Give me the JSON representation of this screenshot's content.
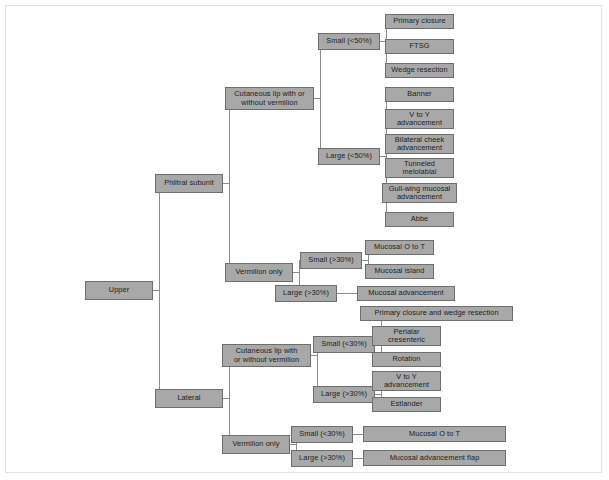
{
  "diagram": {
    "type": "tree-flowchart",
    "colors": {
      "node_fill": "#a8a8a8",
      "node_border": "#6e6e6e",
      "edge": "#8c8c8c",
      "frame": "#e2e2e2",
      "background": "#ffffff",
      "text": "#1c1c1c"
    },
    "nodes": [
      {
        "id": "upper",
        "label": "Upper",
        "x": 85,
        "y": 281,
        "w": 68,
        "h": 19
      },
      {
        "id": "philtral",
        "label": "Philtral subunit",
        "x": 155,
        "y": 174,
        "w": 68,
        "h": 19
      },
      {
        "id": "lateral",
        "label": "Lateral",
        "x": 155,
        "y": 389,
        "w": 68,
        "h": 19
      },
      {
        "id": "p-cut",
        "label": "Cutaneous lip with or\nwithout vermilion",
        "x": 225,
        "y": 87,
        "w": 89,
        "h": 23
      },
      {
        "id": "p-verm",
        "label": "Vermilion only",
        "x": 225,
        "y": 263,
        "w": 68,
        "h": 19
      },
      {
        "id": "p-cut-small",
        "label": "Small (<50%)",
        "x": 318,
        "y": 33,
        "w": 62,
        "h": 17
      },
      {
        "id": "p-cut-large",
        "label": "Large (<50%)",
        "x": 318,
        "y": 148,
        "w": 62,
        "h": 17
      },
      {
        "id": "primary-closure",
        "label": "Primary closure",
        "x": 385,
        "y": 14,
        "w": 69,
        "h": 15
      },
      {
        "id": "ftsg",
        "label": "FTSG",
        "x": 385,
        "y": 39,
        "w": 69,
        "h": 15
      },
      {
        "id": "wedge-resection",
        "label": "Wedge resection",
        "x": 385,
        "y": 63,
        "w": 69,
        "h": 15
      },
      {
        "id": "banner",
        "label": "Banner",
        "x": 385,
        "y": 87,
        "w": 69,
        "h": 15
      },
      {
        "id": "v-to-y-1",
        "label": "V to Y\nadvancement",
        "x": 385,
        "y": 109,
        "w": 69,
        "h": 20
      },
      {
        "id": "bilat-cheek",
        "label": "Bilateral cheek\nadvancement",
        "x": 385,
        "y": 134,
        "w": 69,
        "h": 20
      },
      {
        "id": "tunneled-melo",
        "label": "Tunneled\nmelolabial",
        "x": 385,
        "y": 158,
        "w": 69,
        "h": 20
      },
      {
        "id": "gull-wing",
        "label": "Gull-wing mucosal\nadvancement",
        "x": 382,
        "y": 183,
        "w": 75,
        "h": 20
      },
      {
        "id": "abbe",
        "label": "Abbe",
        "x": 385,
        "y": 212,
        "w": 69,
        "h": 15
      },
      {
        "id": "p-verm-small",
        "label": "Small (>30%)",
        "x": 300,
        "y": 252,
        "w": 62,
        "h": 17
      },
      {
        "id": "p-verm-large",
        "label": "Large (>30%)",
        "x": 275,
        "y": 285,
        "w": 62,
        "h": 17
      },
      {
        "id": "mucosal-o-to-t-1",
        "label": "Mucosal O to T",
        "x": 365,
        "y": 240,
        "w": 69,
        "h": 15
      },
      {
        "id": "mucosal-island",
        "label": "Mucosal island",
        "x": 365,
        "y": 264,
        "w": 69,
        "h": 15
      },
      {
        "id": "mucosal-adv",
        "label": "Mucosal advancement",
        "x": 357,
        "y": 286,
        "w": 98,
        "h": 15
      },
      {
        "id": "l-cut",
        "label": "Cutaneous lip with\nor without vermilion",
        "x": 222,
        "y": 344,
        "w": 89,
        "h": 23
      },
      {
        "id": "l-verm",
        "label": "Vermilion only",
        "x": 222,
        "y": 435,
        "w": 68,
        "h": 19
      },
      {
        "id": "l-cut-small",
        "label": "Small (<30%)",
        "x": 313,
        "y": 336,
        "w": 62,
        "h": 17
      },
      {
        "id": "l-cut-large",
        "label": "Large (>30%)",
        "x": 313,
        "y": 386,
        "w": 62,
        "h": 17
      },
      {
        "id": "primary-wedge",
        "label": "Primary closure and wedge resection",
        "x": 360,
        "y": 306,
        "w": 153,
        "h": 15
      },
      {
        "id": "perialar",
        "label": "Perialar\ncresenteric",
        "x": 372,
        "y": 326,
        "w": 69,
        "h": 20
      },
      {
        "id": "rotation",
        "label": "Rotation",
        "x": 372,
        "y": 352,
        "w": 69,
        "h": 15
      },
      {
        "id": "v-to-y-2",
        "label": "V to Y\nadvancement",
        "x": 372,
        "y": 371,
        "w": 69,
        "h": 20
      },
      {
        "id": "estlander",
        "label": "Estlander",
        "x": 372,
        "y": 397,
        "w": 69,
        "h": 15
      },
      {
        "id": "l-verm-small",
        "label": "Small (<30%)",
        "x": 291,
        "y": 426,
        "w": 62,
        "h": 17
      },
      {
        "id": "l-verm-large",
        "label": "Large (>30%)",
        "x": 291,
        "y": 450,
        "w": 62,
        "h": 17
      },
      {
        "id": "mucosal-o-to-t-2",
        "label": "Mucosal O to T",
        "x": 363,
        "y": 426,
        "w": 143,
        "h": 16
      },
      {
        "id": "mucosal-adv-flap",
        "label": "Mucosal advancement flap",
        "x": 363,
        "y": 450,
        "w": 143,
        "h": 16
      }
    ],
    "edges": [
      {
        "from": "upper",
        "to": [
          "philtral",
          "lateral"
        ]
      },
      {
        "from": "philtral",
        "to": [
          "p-cut",
          "p-verm"
        ]
      },
      {
        "from": "p-cut",
        "to": [
          "p-cut-small",
          "p-cut-large"
        ]
      },
      {
        "from": "p-cut-small",
        "to": [
          "primary-closure",
          "ftsg",
          "wedge-resection"
        ]
      },
      {
        "from": "p-cut-large",
        "to": [
          "banner",
          "v-to-y-1",
          "bilat-cheek",
          "tunneled-melo",
          "gull-wing",
          "abbe"
        ]
      },
      {
        "from": "p-verm",
        "to": [
          "p-verm-small",
          "p-verm-large"
        ]
      },
      {
        "from": "p-verm-small",
        "to": [
          "mucosal-o-to-t-1",
          "mucosal-island"
        ]
      },
      {
        "from": "p-verm-large",
        "to": [
          "mucosal-adv"
        ]
      },
      {
        "from": "lateral",
        "to": [
          "l-cut",
          "l-verm"
        ]
      },
      {
        "from": "l-cut",
        "to": [
          "l-cut-small",
          "l-cut-large"
        ]
      },
      {
        "from": "l-cut-small",
        "to": [
          "primary-wedge",
          "perialar",
          "rotation"
        ]
      },
      {
        "from": "l-cut-large",
        "to": [
          "v-to-y-2",
          "estlander"
        ]
      },
      {
        "from": "l-verm",
        "to": [
          "l-verm-small",
          "l-verm-large"
        ]
      },
      {
        "from": "l-verm-small",
        "to": [
          "mucosal-o-to-t-2"
        ]
      },
      {
        "from": "l-verm-large",
        "to": [
          "mucosal-adv-flap"
        ]
      }
    ]
  }
}
